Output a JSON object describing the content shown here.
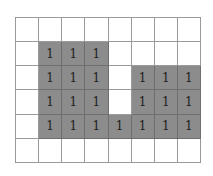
{
  "grid": {
    "rows": 6,
    "cols": 8,
    "filled_color": "#8c8c8c",
    "empty_color": "#ffffff",
    "cells": [
      [
        "",
        "",
        "",
        "",
        "",
        "",
        "",
        ""
      ],
      [
        "",
        "1",
        "1",
        "1",
        "",
        "",
        "",
        ""
      ],
      [
        "",
        "1",
        "1",
        "1",
        "",
        "1",
        "1",
        "1"
      ],
      [
        "",
        "1",
        "1",
        "1",
        "",
        "1",
        "1",
        "1"
      ],
      [
        "",
        "1",
        "1",
        "1",
        "1",
        "1",
        "1",
        "1"
      ],
      [
        "",
        "",
        "",
        "",
        "",
        "",
        "",
        ""
      ]
    ]
  }
}
